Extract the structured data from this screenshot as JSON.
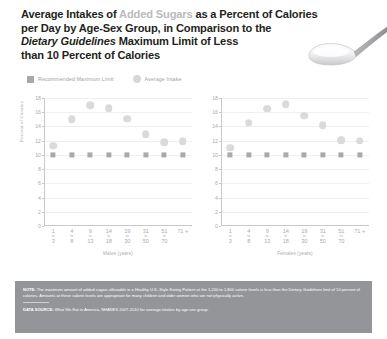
{
  "title": {
    "line1_a": "Average Intakes of ",
    "line1_b": "Added Sugars",
    "line1_c": " as a Percent of Calories",
    "line2": "per Day by Age-Sex Group, in Comparison to the",
    "line3_a": "Dietary Guidelines",
    "line3_b": " Maximum Limit of Less",
    "line4": "than 10 Percent of Calories"
  },
  "legend": {
    "items": [
      {
        "label": "Recommended Maximum Limit",
        "marker": "square-swatch-icon",
        "color": "#a7a9ac"
      },
      {
        "label": "Average Intake",
        "marker": "circle-swatch-icon",
        "color": "#d6d7d9"
      }
    ]
  },
  "footer": {
    "note_label": "NOTE:",
    "note_text": " The maximum amount of added sugars allowable in a Healthy U.S.-Style Eating Pattern at the 1,200 to 1,800 calorie levels is less than the Dietary Guidelines limit of 10 percent of calories. Amounts at these calorie levels are appropriate for many children and older women who are not physically active.",
    "source_label": "DATA SOURCE:",
    "source_text": " What We Eat in America, NHANES 2007-2010 for average intakes by age-sex group."
  },
  "chart_data": [
    {
      "type": "scatter",
      "title": "Males",
      "xlabel": "Males (years)",
      "ylabel": "Percent of Calories",
      "ylim": [
        0,
        18
      ],
      "yticks": [
        0,
        2,
        4,
        6,
        8,
        10,
        12,
        14,
        16,
        18
      ],
      "grid": true,
      "categories": [
        "1 to 3",
        "4 to 8",
        "9 to 13",
        "14 to 18",
        "19 to 30",
        "31 to 50",
        "51 to 70",
        "71 +"
      ],
      "category_parts": [
        {
          "from": "1",
          "to": "to",
          "end": "3"
        },
        {
          "from": "4",
          "to": "to",
          "end": "8"
        },
        {
          "from": "9",
          "to": "to",
          "end": "13"
        },
        {
          "from": "14",
          "to": "to",
          "end": "18"
        },
        {
          "from": "19",
          "to": "to",
          "end": "30"
        },
        {
          "from": "31",
          "to": "to",
          "end": "50"
        },
        {
          "from": "51",
          "to": "to",
          "end": "70"
        },
        {
          "from": "71 +",
          "to": "",
          "end": ""
        }
      ],
      "series": [
        {
          "name": "Average Intake",
          "marker": "circle",
          "color": "#d9dadc",
          "values": [
            11.3,
            15.0,
            17.0,
            16.6,
            15.1,
            12.9,
            11.8,
            11.9
          ]
        },
        {
          "name": "Recommended Maximum Limit",
          "marker": "square",
          "color": "#a7a9ac",
          "values": [
            10,
            10,
            10,
            10,
            10,
            10,
            10,
            10
          ]
        }
      ]
    },
    {
      "type": "scatter",
      "title": "Females",
      "xlabel": "Females (years)",
      "ylabel": "Percent of Calories",
      "ylim": [
        0,
        18
      ],
      "yticks": [
        0,
        2,
        4,
        6,
        8,
        10,
        12,
        14,
        16,
        18
      ],
      "grid": true,
      "categories": [
        "1 to 3",
        "4 to 8",
        "9 to 13",
        "14 to 18",
        "19 to 30",
        "31 to 50",
        "51 to 70",
        "71 +"
      ],
      "category_parts": [
        {
          "from": "1",
          "to": "to",
          "end": "3"
        },
        {
          "from": "4",
          "to": "to",
          "end": "8"
        },
        {
          "from": "9",
          "to": "to",
          "end": "13"
        },
        {
          "from": "14",
          "to": "to",
          "end": "18"
        },
        {
          "from": "19",
          "to": "to",
          "end": "30"
        },
        {
          "from": "31",
          "to": "to",
          "end": "50"
        },
        {
          "from": "51",
          "to": "to",
          "end": "70"
        },
        {
          "from": "71 +",
          "to": "",
          "end": ""
        }
      ],
      "series": [
        {
          "name": "Average Intake",
          "marker": "circle",
          "color": "#d9dadc",
          "values": [
            11.0,
            14.5,
            16.5,
            17.1,
            15.5,
            14.2,
            12.1,
            12.0
          ]
        },
        {
          "name": "Recommended Maximum Limit",
          "marker": "square",
          "color": "#a7a9ac",
          "values": [
            10,
            10,
            10,
            10,
            10,
            10,
            10,
            10
          ]
        }
      ]
    }
  ]
}
